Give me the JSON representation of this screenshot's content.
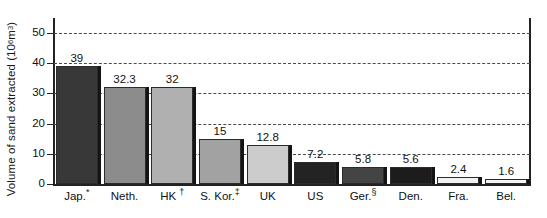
{
  "chart_data": {
    "type": "bar",
    "title": "",
    "xlabel": "",
    "ylabel": "Volume of sand extracted (10⁶ m³)",
    "ylabel_prefix": "Volume of sand extracted (10",
    "ylabel_exponent": "6",
    "ylabel_suffix": " m",
    "ylabel_exponent2": "3",
    "ylabel_close": ")",
    "ylim": [
      0,
      55
    ],
    "yticks": [
      0,
      10,
      20,
      30,
      40,
      50
    ],
    "ytick_labels": [
      "0",
      "10",
      "20",
      "30",
      "40",
      "50"
    ],
    "grid": true,
    "grid_style": "dashed",
    "legend": "none",
    "categories": [
      "Jap.*",
      "Neth.",
      "HK †",
      "S. Kor.‡",
      "UK",
      "US",
      "Ger.§",
      "Den.",
      "Fra.",
      "Bel."
    ],
    "values": [
      39,
      32.3,
      32,
      15,
      12.8,
      7.2,
      5.8,
      5.6,
      2.4,
      1.6
    ],
    "value_labels": [
      "39",
      "32.3",
      "32",
      "15",
      "12.8",
      "7.2",
      "5.8",
      "5.6",
      "2.4",
      "1.6"
    ],
    "bar_colors": [
      "#383838",
      "#8c8c8c",
      "#b0b0b0",
      "#a2a2a2",
      "#cccccc",
      "#232323",
      "#444444",
      "#1c1c1c",
      "#f2f2f2",
      "#f5f5f5"
    ],
    "bars": [
      {
        "label": "Jap.*",
        "label_main": "Jap.",
        "label_sup": "*",
        "value": 39,
        "value_label": "39",
        "color": "#383838"
      },
      {
        "label": "Neth.",
        "label_main": "Neth.",
        "label_sup": "",
        "value": 32.3,
        "value_label": "32.3",
        "color": "#8c8c8c"
      },
      {
        "label": "HK †",
        "label_main": "HK ",
        "label_sup": "†",
        "value": 32,
        "value_label": "32",
        "color": "#b0b0b0"
      },
      {
        "label": "S. Kor.‡",
        "label_main": "S. Kor.",
        "label_sup": "‡",
        "value": 15,
        "value_label": "15",
        "color": "#a2a2a2"
      },
      {
        "label": "UK",
        "label_main": "UK",
        "label_sup": "",
        "value": 12.8,
        "value_label": "12.8",
        "color": "#cccccc"
      },
      {
        "label": "US",
        "label_main": "US",
        "label_sup": "",
        "value": 7.2,
        "value_label": "7.2",
        "color": "#232323"
      },
      {
        "label": "Ger.§",
        "label_main": "Ger.",
        "label_sup": "§",
        "value": 5.8,
        "value_label": "5.8",
        "color": "#444444"
      },
      {
        "label": "Den.",
        "label_main": "Den.",
        "label_sup": "",
        "value": 5.6,
        "value_label": "5.6",
        "color": "#1c1c1c"
      },
      {
        "label": "Fra.",
        "label_main": "Fra.",
        "label_sup": "",
        "value": 2.4,
        "value_label": "2.4",
        "color": "#f2f2f2"
      },
      {
        "label": "Bel.",
        "label_main": "Bel.",
        "label_sup": "",
        "value": 1.6,
        "value_label": "1.6",
        "color": "#f5f5f5"
      }
    ]
  }
}
